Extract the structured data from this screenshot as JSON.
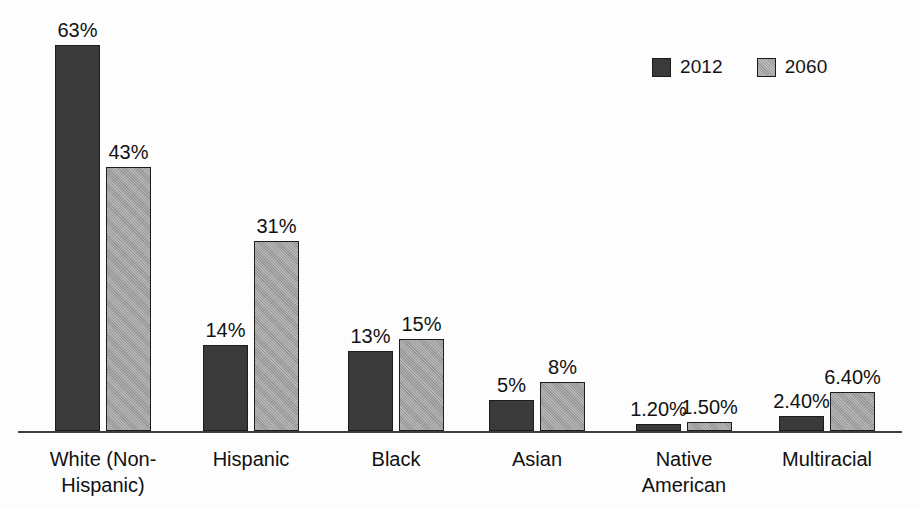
{
  "chart_data": {
    "type": "bar",
    "title": "",
    "subtitle": "",
    "xlabel": "",
    "ylabel": "",
    "grid": false,
    "legend_position": "top-right",
    "ylim": [
      0,
      70
    ],
    "categories": [
      "White (Non-\nHispanic)",
      "Hispanic",
      "Black",
      "Asian",
      "Native\nAmerican",
      "Multiracial"
    ],
    "series": [
      {
        "name": "2012",
        "color": "#3a3a3a",
        "values": [
          63,
          14,
          13,
          5,
          1.2,
          2.4
        ],
        "labels": [
          "63%",
          "14%",
          "13%",
          "5%",
          "1.20%",
          "2.40%"
        ]
      },
      {
        "name": "2060",
        "color": "#9c9c9c",
        "values": [
          43,
          31,
          15,
          8,
          1.5,
          6.4
        ],
        "labels": [
          "43%",
          "31%",
          "15%",
          "8%",
          "1.50%",
          "6.40%"
        ]
      }
    ]
  },
  "legend": {
    "entries": [
      {
        "label": "2012",
        "swatch": "dark-square-icon"
      },
      {
        "label": "2060",
        "swatch": "light-square-icon"
      }
    ]
  },
  "axis": {
    "baseline_visible": true
  },
  "colors": {
    "series_2012": "#3a3a3a",
    "series_2060": "#9c9c9c",
    "outline": "#1d1d1d",
    "background": "#fdfdfd",
    "text": "#111111"
  }
}
